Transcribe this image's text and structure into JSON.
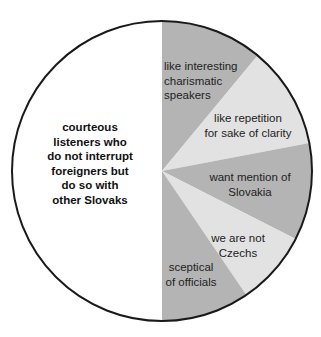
{
  "chart_data": {
    "type": "pie",
    "title": "",
    "start_angle_deg": -90,
    "direction": "clockwise",
    "slices": [
      {
        "label_lines": [
          "like interesting",
          "charismatic",
          "speakers"
        ],
        "value": 11.0,
        "color": "#b4b4b4",
        "bold": false,
        "anchor": "start",
        "label_x": 164,
        "label_y": 70
      },
      {
        "label_lines": [
          "like repetition",
          "for sake of clarity"
        ],
        "value": 11.0,
        "color": "#e2e2e2",
        "bold": false,
        "anchor": "middle",
        "label_x": 248,
        "label_y": 122
      },
      {
        "label_lines": [
          "want mention of",
          "Slovakia"
        ],
        "value": 10.5,
        "color": "#b4b4b4",
        "bold": false,
        "anchor": "middle",
        "label_x": 250,
        "label_y": 181
      },
      {
        "label_lines": [
          "we are not",
          "Czechs"
        ],
        "value": 8.0,
        "color": "#e2e2e2",
        "bold": false,
        "anchor": "middle",
        "label_x": 238,
        "label_y": 242
      },
      {
        "label_lines": [
          "sceptical",
          "of officials"
        ],
        "value": 9.5,
        "color": "#b4b4b4",
        "bold": false,
        "anchor": "middle",
        "label_x": 191,
        "label_y": 271
      },
      {
        "label_lines": [
          "courteous",
          "listeners who",
          "do not interrupt",
          "foreigners but",
          "do so with",
          "other Slovaks"
        ],
        "value": 50.0,
        "color": "#ffffff",
        "bold": true,
        "anchor": "middle",
        "label_x": 90,
        "label_y": 131
      }
    ],
    "legend": null,
    "border_color": "#1a1a1a"
  },
  "geometry": {
    "cx": 162,
    "cy": 171,
    "r": 150,
    "line_height": 14.5
  }
}
